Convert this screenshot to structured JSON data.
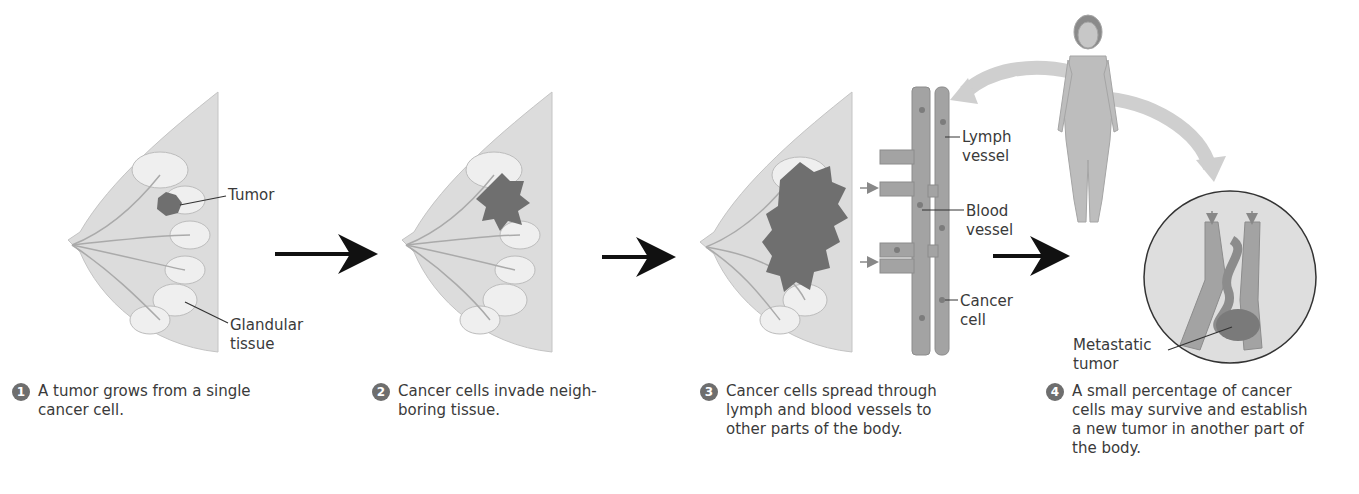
{
  "figure": {
    "colors": {
      "tissue": "#d9d9d9",
      "tissue_edge": "#bdbdbd",
      "gland": "#ececec",
      "tumor": "#6f6f6f",
      "vessel": "#9a9a9a",
      "arrow": "#111111",
      "curved_arrow": "#cfcfcf",
      "step_badge": "#6e6e6e"
    },
    "labels": {
      "tumor": "Tumor",
      "glandular_1": "Glandular",
      "glandular_2": "tissue",
      "lymph_1": "Lymph",
      "lymph_2": "vessel",
      "blood_1": "Blood",
      "blood_2": "vessel",
      "cancer_1": "Cancer",
      "cancer_2": "cell",
      "meta_1": "Metastatic",
      "meta_2": "tumor"
    },
    "steps": [
      {
        "number": "1",
        "text": "A tumor grows from a single cancer cell."
      },
      {
        "number": "2",
        "text": "Cancer cells invade neigh-boring tissue."
      },
      {
        "number": "3",
        "text": "Cancer cells spread through lymph and blood vessels to other parts of the body."
      },
      {
        "number": "4",
        "text": "A small percentage of cancer cells may survive and establish a new tumor in another part of the body."
      }
    ]
  }
}
